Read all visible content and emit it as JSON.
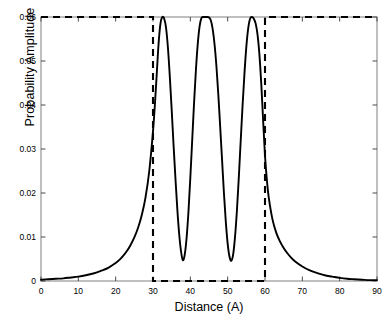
{
  "chart_data": {
    "type": "line",
    "title": "",
    "xlabel": "Distance (A)",
    "ylabel": "Probability Amplitude",
    "xlim": [
      0,
      90
    ],
    "ylim": [
      0,
      0.06
    ],
    "xticks": [
      0,
      10,
      20,
      30,
      40,
      50,
      60,
      70,
      80,
      90
    ],
    "xtick_labels": [
      "0",
      "10",
      "20",
      "30",
      "40",
      "50",
      "60",
      "70",
      "80",
      "90"
    ],
    "yticks": [
      0,
      0.01,
      0.02,
      0.03,
      0.04,
      0.05,
      0.06
    ],
    "ytick_labels": [
      "0",
      "0.01",
      "0.02",
      "0.03",
      "0.04",
      "0.05",
      "0.06"
    ],
    "grid": false,
    "legend": "none",
    "series": [
      {
        "name": "Probability Amplitude",
        "style": "solid",
        "color": "#000000",
        "linewidth": 1.9,
        "x": [
          0,
          2,
          4,
          6,
          8,
          10,
          12,
          14,
          16,
          18,
          20,
          21,
          22,
          23,
          24,
          25,
          26,
          27,
          28,
          29,
          30,
          30.5,
          31,
          31.5,
          32,
          32.5,
          33,
          33.5,
          34,
          34.5,
          35,
          35.5,
          36,
          36.5,
          37,
          37.5,
          38,
          38.5,
          39,
          39.5,
          40,
          40.5,
          41,
          41.5,
          42,
          42.5,
          43,
          43.5,
          44,
          44.5,
          45,
          45.5,
          46,
          46.5,
          47,
          47.5,
          48,
          48.5,
          49,
          49.5,
          50,
          50.5,
          51,
          51.5,
          52,
          52.5,
          53,
          53.5,
          54,
          54.5,
          55,
          55.5,
          56,
          56.5,
          57,
          57.5,
          58,
          58.5,
          59,
          59.5,
          60,
          60.5,
          61,
          62,
          63,
          64,
          65,
          66,
          67,
          68,
          70,
          72,
          74,
          76,
          78,
          80,
          82,
          84,
          86,
          88,
          90
        ],
        "y": [
          0.0003,
          0.0004,
          0.0005,
          0.0006,
          0.0008,
          0.001,
          0.0013,
          0.0017,
          0.0023,
          0.003,
          0.0041,
          0.0048,
          0.0057,
          0.0068,
          0.0082,
          0.0099,
          0.0121,
          0.015,
          0.019,
          0.025,
          0.034,
          0.04,
          0.047,
          0.054,
          0.0585,
          0.06,
          0.0596,
          0.0575,
          0.053,
          0.0465,
          0.039,
          0.031,
          0.0235,
          0.0165,
          0.0108,
          0.0068,
          0.0047,
          0.006,
          0.0098,
          0.0158,
          0.0235,
          0.032,
          0.0405,
          0.048,
          0.054,
          0.058,
          0.0598,
          0.06,
          0.06,
          0.06,
          0.0599,
          0.0592,
          0.0572,
          0.0537,
          0.0487,
          0.0423,
          0.035,
          0.0275,
          0.02,
          0.0135,
          0.0085,
          0.0055,
          0.0046,
          0.0062,
          0.0103,
          0.0163,
          0.0238,
          0.032,
          0.04,
          0.0472,
          0.0532,
          0.0574,
          0.0596,
          0.06,
          0.0596,
          0.0585,
          0.056,
          0.0515,
          0.0448,
          0.0365,
          0.0285,
          0.023,
          0.019,
          0.014,
          0.011,
          0.009,
          0.0075,
          0.0063,
          0.0053,
          0.0045,
          0.0033,
          0.0024,
          0.0018,
          0.0013,
          0.001,
          0.0007,
          0.0005,
          0.0004,
          0.0003,
          0.0002,
          0.0002
        ]
      },
      {
        "name": "Potential Barrier",
        "style": "dashed",
        "color": "#000000",
        "linewidth": 2.1,
        "x": [
          0,
          30,
          30,
          60,
          60,
          90
        ],
        "y": [
          0.06,
          0.06,
          0,
          0,
          0.06,
          0.06
        ]
      }
    ],
    "annotations": [
      {
        "text": "well region",
        "x_start": 30,
        "x_end": 60
      }
    ]
  }
}
